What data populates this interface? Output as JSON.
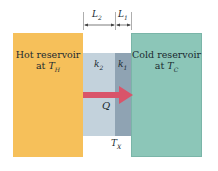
{
  "diagram": {
    "hot_reservoir": {
      "label_line1": "Hot reservoir",
      "label_line2_prefix": "at ",
      "temperature_symbol": "T",
      "temperature_subscript": "H",
      "color": "#f6c05a"
    },
    "cold_reservoir": {
      "label_line1": "Cold reservoir",
      "label_line2_prefix": "at ",
      "temperature_symbol": "T",
      "temperature_subscript": "C",
      "color": "#8cc6b8"
    },
    "slabs": [
      {
        "id": "slab-2",
        "conductivity_symbol": "k",
        "conductivity_subscript": "2",
        "thickness_symbol": "L",
        "thickness_subscript": "2",
        "color": "#c3d2dc"
      },
      {
        "id": "slab-1",
        "conductivity_symbol": "k",
        "conductivity_subscript": "1",
        "thickness_symbol": "L",
        "thickness_subscript": "1",
        "color": "#8fa3b3"
      }
    ],
    "heat_flow": {
      "symbol": "Q",
      "direction": "left-to-right",
      "arrow_color": "#d9546a"
    },
    "interface_temperature": {
      "symbol": "T",
      "subscript": "X"
    }
  }
}
